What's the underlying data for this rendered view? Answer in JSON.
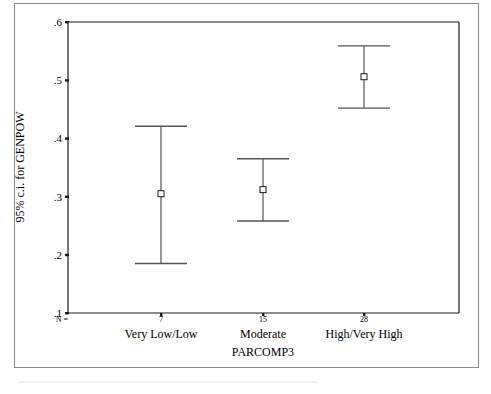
{
  "chart_data": {
    "type": "errorbar",
    "title": "",
    "xlabel": "PARCOMP3",
    "ylabel": "95% c.i. for GENPOW",
    "ylim": [
      0.1,
      0.6
    ],
    "yticks": [
      ".1",
      ".2",
      ".3",
      ".4",
      ".5",
      ".6"
    ],
    "grid": false,
    "legend": null,
    "n_prefix": "N =",
    "categories": [
      "Very Low/Low",
      "Moderate",
      "High/Very High"
    ],
    "n": [
      7,
      15,
      28
    ],
    "series": [
      {
        "name": "GENPOW",
        "mean": [
          0.305,
          0.312,
          0.506
        ],
        "lower": [
          0.185,
          0.258,
          0.452
        ],
        "upper": [
          0.421,
          0.365,
          0.559
        ]
      }
    ]
  },
  "labels": {
    "y_axis_title": "95% c.i. for GENPOW",
    "x_axis_title": "PARCOMP3",
    "n_prefix": "N =",
    "ticks": [
      ".1",
      ".2",
      ".3",
      ".4",
      ".5",
      ".6"
    ],
    "categories": [
      "Very Low/Low",
      "Moderate",
      "High/Very High"
    ],
    "n_values": [
      "7",
      "15",
      "28"
    ]
  },
  "colors": {
    "ink": "#1a1a1a",
    "bar": "#555555",
    "frame": "#8a8a8a"
  }
}
